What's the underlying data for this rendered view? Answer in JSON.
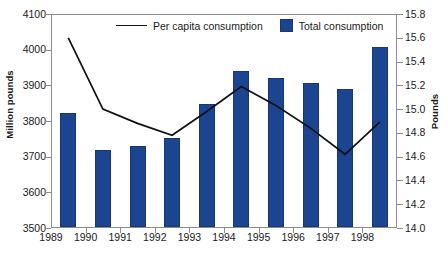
{
  "chart_data": {
    "type": "bar",
    "title": "",
    "subtitle": "",
    "xlabel": "",
    "ylabel": "Million pounds",
    "ylabel_secondary": "Pounds",
    "categories": [
      "1989",
      "1990",
      "1991",
      "1992",
      "1993",
      "1994",
      "1995",
      "1996",
      "1997",
      "1998"
    ],
    "ylim": [
      3500,
      4100
    ],
    "ylim_secondary": [
      14.0,
      15.8
    ],
    "yticks": [
      "3500",
      "3600",
      "3700",
      "3800",
      "3900",
      "4000",
      "4100"
    ],
    "yticks_secondary": [
      "14.0",
      "14.2",
      "14.4",
      "14.6",
      "14.8",
      "15.0",
      "15.2",
      "15.4",
      "15.6",
      "15.8"
    ],
    "grid": false,
    "legend_position": "top-inside",
    "series": [
      {
        "name": "Total consumption",
        "render": "bar",
        "axis": "left",
        "color": "#1b4491",
        "values": [
          3822,
          3718,
          3730,
          3752,
          3848,
          3940,
          3920,
          3907,
          3890,
          4008
        ]
      },
      {
        "name": "Per capita consumption",
        "render": "line",
        "axis": "right",
        "color": "#111111",
        "values": [
          15.6,
          15.0,
          14.88,
          14.78,
          14.98,
          15.19,
          15.03,
          14.84,
          14.62,
          14.89
        ]
      }
    ]
  },
  "legend": {
    "line_label": "Per capita consumption",
    "bar_label": "Total consumption"
  }
}
